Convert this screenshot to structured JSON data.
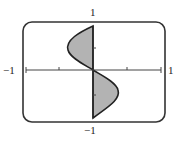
{
  "graph": {
    "equation": "x = y^3 - y",
    "labels": {
      "top": "1",
      "bottom": "−1",
      "left": "−1",
      "right": "1"
    },
    "x_range": [
      -1,
      1
    ],
    "y_range": [
      -1,
      1
    ],
    "tick_interval": 0.5,
    "shaded_region": "between curve and y-axis",
    "colors": {
      "fill": "#b3b3b3",
      "stroke": "#222222",
      "frame": "#333333"
    }
  }
}
